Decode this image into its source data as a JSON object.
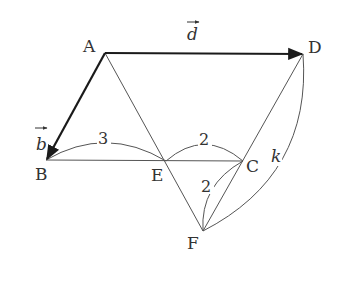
{
  "points": {
    "A": {
      "label": "A",
      "x": 105,
      "y": 53
    },
    "D": {
      "label": "D",
      "x": 303,
      "y": 54
    },
    "B": {
      "label": "B",
      "x": 46,
      "y": 160
    },
    "E": {
      "label": "E",
      "x": 166,
      "y": 161
    },
    "C": {
      "label": "C",
      "x": 243,
      "y": 161
    },
    "F": {
      "label": "F",
      "x": 203,
      "y": 231
    }
  },
  "vectors": {
    "b": {
      "label": "b",
      "from": "A",
      "to": "B"
    },
    "d": {
      "label": "d",
      "from": "A",
      "to": "D"
    }
  },
  "measurements": {
    "BE": "3",
    "EC": "2",
    "CF": "2",
    "DF": "k"
  },
  "colors": {
    "stroke": "#444444",
    "vector": "#1a1a1a",
    "text": "#333333"
  }
}
